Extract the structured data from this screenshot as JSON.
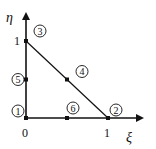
{
  "diagram": {
    "axes": {
      "x_label": "ξ",
      "y_label": "η",
      "origin_label": "0",
      "x_tick_label": "1",
      "y_tick_label": "1"
    },
    "nodes": [
      {
        "id": "1",
        "xi": 0,
        "eta": 0
      },
      {
        "id": "2",
        "xi": 1,
        "eta": 0
      },
      {
        "id": "3",
        "xi": 0,
        "eta": 1
      },
      {
        "id": "4",
        "xi": 0.5,
        "eta": 0.5
      },
      {
        "id": "5",
        "xi": 0,
        "eta": 0.5
      },
      {
        "id": "6",
        "xi": 0.5,
        "eta": 0
      }
    ],
    "edges": [
      [
        "2",
        "3"
      ]
    ],
    "colors": {
      "ink": "#111111",
      "background": "#ffffff"
    }
  }
}
